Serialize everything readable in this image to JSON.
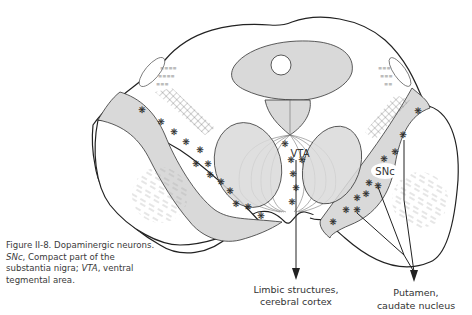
{
  "figure": {
    "caption": {
      "title": "Figure II-8. Dopaminergic neurons.",
      "abbr1": "SNc",
      "abbr1_def": ", Compact part of the substantia nigra; ",
      "abbr2": "VTA",
      "abbr2_def": ", ventral tegmental area."
    },
    "labels": {
      "vta": "VTA",
      "snc": "SNc",
      "limbic_line1": "Limbic structures,",
      "limbic_line2": "cerebral cortex",
      "putamen_line1": "Putamen,",
      "putamen_line2": "caudate nucleus"
    },
    "colors": {
      "gray_fill": "#d9d9d9",
      "outline": "#222222",
      "text": "#333333"
    },
    "neuron_marker": "❋"
  }
}
